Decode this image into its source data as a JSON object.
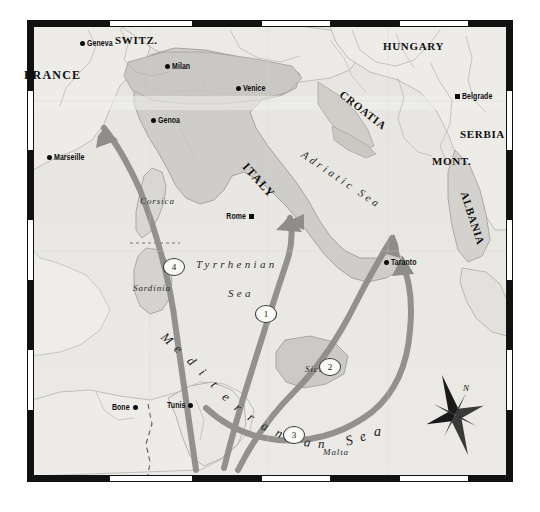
{
  "map": {
    "title": "Mediterranean Theatre Operations Map",
    "projection_frame": "black-white-graticule-border",
    "background_color": "#e8e7e3",
    "land_color": "#e9e8e4",
    "italy_fill": "#cfcecb",
    "arrow_color": "#8e8d8b",
    "frame_color": "#111111",
    "countries": [
      {
        "name": "FRANCE",
        "x": 24,
        "y": 68,
        "size": "big",
        "rot": 0
      },
      {
        "name": "SWITZ.",
        "x": 115,
        "y": 34,
        "size": "norm",
        "rot": 0
      },
      {
        "name": "HUNGARY",
        "x": 383,
        "y": 40,
        "size": "norm",
        "rot": 0
      },
      {
        "name": "CROATIA",
        "x": 345,
        "y": 88,
        "size": "norm",
        "rot": 38
      },
      {
        "name": "SERBIA",
        "x": 460,
        "y": 128,
        "size": "norm",
        "rot": 0
      },
      {
        "name": "MONT.",
        "x": 432,
        "y": 155,
        "size": "norm",
        "rot": 0
      },
      {
        "name": "ALBANIA",
        "x": 470,
        "y": 190,
        "size": "norm",
        "rot": 72
      },
      {
        "name": "ITALY",
        "x": 250,
        "y": 160,
        "size": "big",
        "rot": 48
      }
    ],
    "cities": [
      {
        "name": "Geneva",
        "mx": 82,
        "my": 43,
        "marker": "dot",
        "side": "right"
      },
      {
        "name": "Milan",
        "mx": 167,
        "my": 66,
        "marker": "dot",
        "side": "right"
      },
      {
        "name": "Venice",
        "mx": 238,
        "my": 88,
        "marker": "dot",
        "side": "right"
      },
      {
        "name": "Genoa",
        "mx": 153,
        "my": 120,
        "marker": "dot",
        "side": "right"
      },
      {
        "name": "Marseille",
        "mx": 49,
        "my": 157,
        "marker": "dot",
        "side": "right"
      },
      {
        "name": "Belgrade",
        "mx": 457,
        "my": 96,
        "marker": "square",
        "side": "right"
      },
      {
        "name": "Rome",
        "mx": 251,
        "my": 216,
        "marker": "square",
        "side": "left"
      },
      {
        "name": "Taranto",
        "mx": 386,
        "my": 262,
        "marker": "dot",
        "side": "right"
      },
      {
        "name": "Bone",
        "mx": 135,
        "my": 407,
        "marker": "dot",
        "side": "left"
      },
      {
        "name": "Tunis",
        "mx": 190,
        "my": 405,
        "marker": "dot",
        "side": "left"
      }
    ],
    "seas": [
      {
        "name": "Tyrrhenian",
        "x": 196,
        "y": 258,
        "rot": 0
      },
      {
        "name": "Sea",
        "x": 228,
        "y": 287,
        "rot": 0
      },
      {
        "name": "Adriatic Sea",
        "x": 306,
        "y": 148,
        "rot": 34
      },
      {
        "name": "Mediterranean Sea",
        "x": 0,
        "y": 0,
        "rot": 0
      }
    ],
    "mediterranean_letters": "Mediterranean Sea",
    "islands": [
      {
        "name": "Corsica",
        "x": 140,
        "y": 196,
        "rot": 0
      },
      {
        "name": "Sardinia",
        "x": 133,
        "y": 283,
        "rot": 0
      },
      {
        "name": "Sicily",
        "x": 305,
        "y": 364,
        "rot": 0
      },
      {
        "name": "Malta",
        "x": 323,
        "y": 447,
        "rot": 0
      }
    ],
    "route_markers": [
      {
        "label": "1",
        "x": 265,
        "y": 313
      },
      {
        "label": "2",
        "x": 329,
        "y": 366
      },
      {
        "label": "3",
        "x": 293,
        "y": 434
      },
      {
        "label": "4",
        "x": 173,
        "y": 266
      }
    ],
    "compass": {
      "label": "N",
      "x": 463,
      "y": 383
    }
  }
}
